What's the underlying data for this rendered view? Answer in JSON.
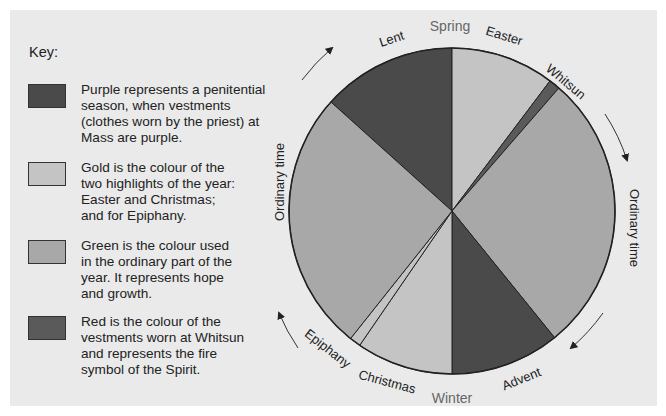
{
  "key": {
    "title": "Key:",
    "items": [
      {
        "name": "purple",
        "color": "#4a4a4a",
        "text": [
          "Purple represents a penitential",
          "season, when vestments",
          "(clothes worn by the priest) at",
          "Mass are purple."
        ]
      },
      {
        "name": "gold",
        "color": "#c4c4c4",
        "text": [
          "Gold is the colour of the",
          "two highlights of the year:",
          "Easter and Christmas;",
          "and for Epiphany."
        ]
      },
      {
        "name": "green",
        "color": "#a8a8a8",
        "text": [
          "Green is the colour used",
          "in the ordinary part of the",
          "year. It represents hope",
          "and growth."
        ]
      },
      {
        "name": "red",
        "color": "#5a5a5a",
        "text": [
          "Red is the colour of the",
          "vestments worn at Whitsun",
          "and represents the fire",
          "symbol of the Spirit."
        ]
      }
    ]
  },
  "wheel": {
    "seasons": {
      "top": "Spring",
      "bottom": "Winter"
    },
    "segments": [
      {
        "label": "Lent",
        "colour": "purple",
        "start_deg": -48,
        "end_deg": 0
      },
      {
        "label": "Easter",
        "colour": "gold",
        "start_deg": 0,
        "end_deg": 37
      },
      {
        "label": "Whitsun",
        "colour": "red",
        "start_deg": 37,
        "end_deg": 41
      },
      {
        "label": "Ordinary time",
        "colour": "green",
        "start_deg": 41,
        "end_deg": 141
      },
      {
        "label": "Advent",
        "colour": "purple",
        "start_deg": 141,
        "end_deg": 180
      },
      {
        "label": "Christmas",
        "colour": "gold",
        "start_deg": 180,
        "end_deg": 214.5
      },
      {
        "label": "Epiphany",
        "colour": "gold",
        "start_deg": 214.5,
        "end_deg": 218.5
      },
      {
        "label": "Ordinary time",
        "colour": "green",
        "start_deg": 218.5,
        "end_deg": 312
      }
    ],
    "colours": {
      "purple": "#4a4a4a",
      "gold": "#c4c4c4",
      "green": "#a8a8a8",
      "red": "#5a5a5a"
    },
    "direction": "clockwise"
  }
}
